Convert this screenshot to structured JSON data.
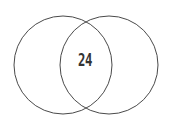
{
  "figure": {
    "kind": "venn-diagram",
    "background_color": "#ffffff",
    "width": 172,
    "height": 129
  },
  "chart_data": {
    "type": "venn",
    "title": "",
    "subtitle": "",
    "xlabel": "",
    "ylabel": "",
    "grid": false,
    "legend": "none",
    "set_count": 2,
    "sets": [
      {
        "name": "left-set",
        "label": "",
        "value": "",
        "center_x": 63,
        "center_y": 65,
        "radius": 49
      },
      {
        "name": "right-set",
        "label": "",
        "value": "",
        "center_x": 109,
        "center_y": 65,
        "radius": 49
      }
    ],
    "regions": [
      {
        "name": "left-only",
        "label": "",
        "value": ""
      },
      {
        "name": "intersection",
        "label": "24",
        "value": 24
      },
      {
        "name": "right-only",
        "label": "",
        "value": ""
      }
    ],
    "annotations": [
      {
        "name": "intersection-count",
        "text": "24",
        "x": 85,
        "y": 61
      }
    ]
  },
  "style": {
    "stroke_color": "#4a4a4a",
    "stroke_width": 1,
    "fill_color": "none",
    "text_color": "#333333"
  },
  "labels": {
    "intersection_value": "24"
  }
}
